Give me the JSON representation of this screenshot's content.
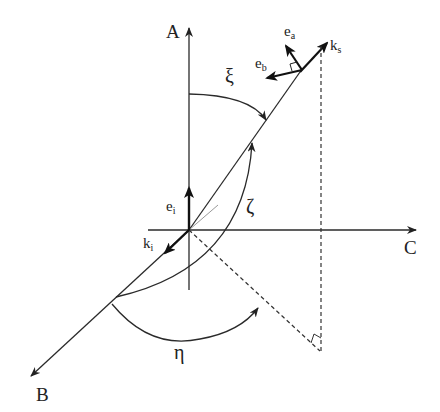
{
  "diagram": {
    "type": "3D scattering geometry diagram",
    "axes": {
      "A": "A",
      "B": "B",
      "C": "C"
    },
    "vectors": {
      "ks": {
        "base": "k",
        "sub": "s"
      },
      "ki": {
        "base": "k",
        "sub": "i"
      },
      "ei": {
        "base": "e",
        "sub": "i"
      },
      "ea": {
        "base": "e",
        "sub": "a"
      },
      "eb": {
        "base": "e",
        "sub": "b"
      }
    },
    "angles": {
      "xi": "ξ",
      "zeta": "ζ",
      "eta": "η"
    },
    "colors": {
      "line": "#2a2a2a",
      "thin": "#888888",
      "background": "#ffffff"
    }
  }
}
